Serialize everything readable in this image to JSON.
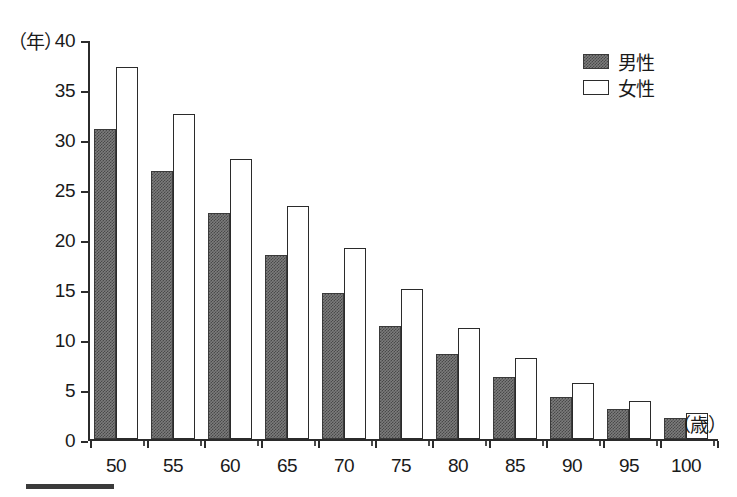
{
  "axes": {
    "y_unit_label": "（年）",
    "x_unit_label": "（歳）",
    "y_ticks": [
      "40",
      "35",
      "30",
      "25",
      "20",
      "15",
      "10",
      "5",
      "0"
    ],
    "x_ticks": [
      "50",
      "55",
      "60",
      "65",
      "70",
      "75",
      "80",
      "85",
      "90",
      "95",
      "100"
    ]
  },
  "legend": {
    "items": [
      {
        "label": "男性",
        "swatch": "male-swatch",
        "color": "#7c7c7c"
      },
      {
        "label": "女性",
        "swatch": "female-swatch",
        "color": "#ffffff"
      }
    ]
  },
  "chart_data": {
    "type": "bar",
    "title": "",
    "subtitle": "",
    "xlabel": "（歳）",
    "ylabel": "（年）",
    "categories": [
      "50",
      "55",
      "60",
      "65",
      "70",
      "75",
      "80",
      "85",
      "90",
      "95",
      "100"
    ],
    "series": [
      {
        "name": "男性",
        "values": [
          31.0,
          26.8,
          22.6,
          18.4,
          14.6,
          11.3,
          8.5,
          6.2,
          4.2,
          3.0,
          2.1
        ]
      },
      {
        "name": "女性",
        "values": [
          37.2,
          32.5,
          28.0,
          23.3,
          19.1,
          15.0,
          11.1,
          8.1,
          5.6,
          3.8,
          2.6
        ]
      }
    ],
    "ylim": [
      0,
      40
    ],
    "ytick_step": 5,
    "grid": false,
    "legend_position": "top-right"
  }
}
